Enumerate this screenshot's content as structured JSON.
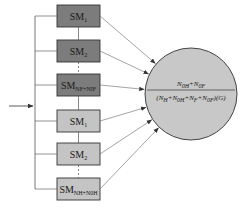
{
  "diagram": {
    "modules": [
      {
        "label": "SM",
        "sub": "1",
        "group": "dark",
        "fill": "#7c7c7c"
      },
      {
        "label": "SM",
        "sub": "2",
        "group": "dark",
        "fill": "#7c7c7c"
      },
      {
        "label": "SM",
        "sub": "NF+NIF",
        "group": "dark",
        "fill": "#7c7c7c"
      },
      {
        "label": "SM",
        "sub": "1",
        "group": "light",
        "fill": "#c4c4c4"
      },
      {
        "label": "SM",
        "sub": "2",
        "group": "light",
        "fill": "#c4c4c4"
      },
      {
        "label": "SM",
        "sub": "NH+N0H",
        "group": "light",
        "fill": "#c4c4c4"
      }
    ],
    "circle": {
      "fill": "#c8c8c8",
      "numerator": "N0H+N0F",
      "denominator": "(NH+N0H+NF+N0F)(G)"
    },
    "caption": ""
  }
}
